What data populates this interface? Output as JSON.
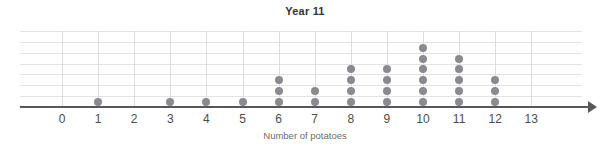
{
  "chart_data": {
    "type": "bar",
    "plot_style": "dot-plot",
    "title": "Year 11",
    "xlabel": "Number of potatoes",
    "ylabel": "",
    "categories": [
      0,
      1,
      2,
      3,
      4,
      5,
      6,
      7,
      8,
      9,
      10,
      11,
      12,
      13
    ],
    "values": [
      0,
      1,
      0,
      1,
      1,
      1,
      3,
      2,
      4,
      4,
      6,
      5,
      3,
      0
    ],
    "tick_labels": [
      "0",
      "1",
      "2",
      "3",
      "4",
      "5",
      "6",
      "7",
      "8",
      "9",
      "10",
      "11",
      "12",
      "13"
    ],
    "xlim": [
      0,
      13
    ],
    "ylim": [
      0,
      7
    ],
    "grid": true,
    "grid_rows": 7,
    "legend": null,
    "total_count": 31,
    "dot_color": "#8a8a8f",
    "gridline_color": "#e3e3e6",
    "axis_color": "#58585b",
    "title_color": "#333333",
    "label_color": "#6b6b6b"
  }
}
